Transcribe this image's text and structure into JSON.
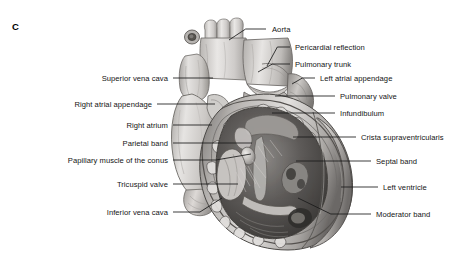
{
  "figure": {
    "panel_letter": "C",
    "caption_subject": "heart-anatomy-anterior-view-opened-right-ventricle",
    "colors": {
      "background": "#ffffff",
      "text": "#141414",
      "leader_line": "#1a1a1a",
      "tissue_light": "#e8e6e4",
      "tissue_mid": "#c2bfbc",
      "tissue_dark": "#8e8b88",
      "cavity_dark": "#4a4846",
      "outline": "#3d3b39"
    }
  },
  "labels_left": [
    {
      "id": "superior-vena-cava",
      "text": "Superior vena cava",
      "text_right": 168,
      "text_top": 74,
      "line_x1": 173,
      "line_x2": 213,
      "line_y": 78,
      "line_y2": 78
    },
    {
      "id": "right-atrial-appendage",
      "text": "Right atrial appendage",
      "text_right": 152,
      "text_top": 100,
      "line_x1": 157,
      "line_x2": 215,
      "line_y": 104,
      "line_y2": 104
    },
    {
      "id": "right-atrium",
      "text": "Right atrium",
      "text_right": 168,
      "text_top": 121,
      "line_x1": 173,
      "line_x2": 212,
      "line_y": 125,
      "line_y2": 125
    },
    {
      "id": "parietal-band",
      "text": "Parietal band",
      "text_right": 168,
      "text_top": 139,
      "line_x1": 173,
      "line_x2": 252,
      "line_y": 143,
      "line_y2": 143
    },
    {
      "id": "papillary-muscle-of-the-conus",
      "text": "Papillary muscle of the conus",
      "text_right": 168,
      "text_top": 156,
      "line_x1": 173,
      "line_x2": 251,
      "line_y": 160,
      "line_y2": 154
    },
    {
      "id": "tricuspid-valve",
      "text": "Tricuspid valve",
      "text_right": 168,
      "text_top": 180,
      "line_x1": 173,
      "line_x2": 238,
      "line_y": 184,
      "line_y2": 184
    },
    {
      "id": "inferior-vena-cava",
      "text": "Inferior vena cava",
      "text_right": 168,
      "text_top": 208,
      "line_x1": 173,
      "line_x2": 222,
      "line_y": 212,
      "line_y2": 198
    }
  ],
  "labels_right": [
    {
      "id": "aorta",
      "text": "Aorta",
      "text_left": 272,
      "text_top": 25,
      "line_x1": 266,
      "line_x2": 229,
      "line_y": 29,
      "line_y2": 40
    },
    {
      "id": "pericardial-reflection",
      "text": "Pericardial reflection",
      "text_left": 295,
      "text_top": 43,
      "line_x1": 290,
      "line_x2": 267,
      "line_y": 47,
      "line_y2": 66
    },
    {
      "id": "pulmonary-trunk",
      "text": "Pulmonary trunk",
      "text_left": 295,
      "text_top": 60,
      "line_x1": 290,
      "line_x2": 258,
      "line_y": 64,
      "line_y2": 72
    },
    {
      "id": "left-atrial-appendage",
      "text": "Left atrial appendage",
      "text_left": 320,
      "text_top": 74,
      "line_x1": 315,
      "line_x2": 292,
      "line_y": 78,
      "line_y2": 84
    },
    {
      "id": "pulmonary-valve",
      "text": "Pulmonary valve",
      "text_left": 340,
      "text_top": 92,
      "line_x1": 335,
      "line_x2": 275,
      "line_y": 96,
      "line_y2": 96
    },
    {
      "id": "infundibulum",
      "text": "Infundibulum",
      "text_left": 340,
      "text_top": 109,
      "line_x1": 335,
      "line_x2": 272,
      "line_y": 113,
      "line_y2": 113
    },
    {
      "id": "crista-supraventricularis",
      "text": "Crista supraventricularis",
      "text_left": 361,
      "text_top": 133,
      "line_x1": 356,
      "line_x2": 293,
      "line_y": 137,
      "line_y2": 137
    },
    {
      "id": "septal-band",
      "text": "Septal band",
      "text_left": 376,
      "text_top": 157,
      "line_x1": 371,
      "line_x2": 296,
      "line_y": 161,
      "line_y2": 161
    },
    {
      "id": "left-ventricle",
      "text": "Left ventricle",
      "text_left": 383,
      "text_top": 183,
      "line_x1": 378,
      "line_x2": 341,
      "line_y": 187,
      "line_y2": 187
    },
    {
      "id": "moderator-band",
      "text": "Moderator band",
      "text_left": 376,
      "text_top": 210,
      "line_x1": 371,
      "line_x2": 298,
      "line_y": 214,
      "line_y2": 198
    }
  ]
}
